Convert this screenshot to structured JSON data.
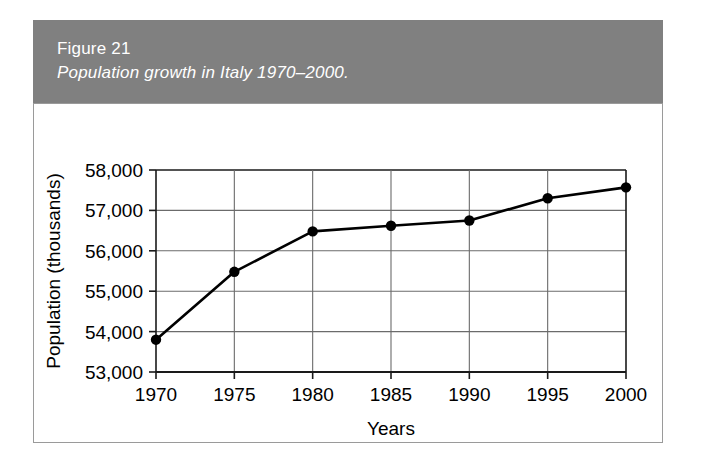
{
  "figure": {
    "number": "Figure 21",
    "caption": "Population growth in Italy 1970–2000.",
    "band_color": "#808080",
    "text_color": "#ffffff"
  },
  "chart_data": {
    "type": "line",
    "title": "Population growth in Italy 1970–2000.",
    "xlabel": "Years",
    "ylabel": "Population (thousands)",
    "categories": [
      "1970",
      "1975",
      "1980",
      "1985",
      "1990",
      "1995",
      "2000"
    ],
    "x": [
      1970,
      1975,
      1980,
      1985,
      1990,
      1995,
      2000
    ],
    "values": [
      53800,
      55480,
      56480,
      56620,
      56750,
      57300,
      57570
    ],
    "xlim": [
      1970,
      2000
    ],
    "ylim": [
      53000,
      58000
    ],
    "xticks": [
      "1970",
      "1975",
      "1980",
      "1985",
      "1990",
      "1995",
      "2000"
    ],
    "yticks": [
      "53,000",
      "54,000",
      "55,000",
      "56,000",
      "57,000",
      "58,000"
    ],
    "grid": true,
    "legend": "none",
    "line_color": "#000000",
    "marker": "circle",
    "marker_color": "#000000",
    "grid_color": "#6b6b6b"
  }
}
